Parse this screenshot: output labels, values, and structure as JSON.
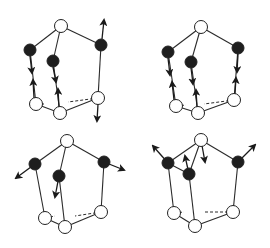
{
  "figure": {
    "colors": {
      "line": "#2a2a2a",
      "black_atom": "#1e1e1e",
      "white_atom": "#ffffff",
      "arrow": "#1a1a1a"
    }
  },
  "panels": [
    {
      "id": "top-left",
      "nodes": [
        {
          "id": "T",
          "x": 61,
          "y": 26,
          "type": "white"
        },
        {
          "id": "L",
          "x": 30,
          "y": 50,
          "type": "black"
        },
        {
          "id": "M",
          "x": 53,
          "y": 61,
          "type": "black"
        },
        {
          "id": "R",
          "x": 101,
          "y": 45,
          "type": "black"
        },
        {
          "id": "BL",
          "x": 36,
          "y": 104,
          "type": "white"
        },
        {
          "id": "BM",
          "x": 60,
          "y": 113,
          "type": "white"
        },
        {
          "id": "BR",
          "x": 98,
          "y": 98,
          "type": "white"
        }
      ],
      "edges": [
        [
          "T",
          "L"
        ],
        [
          "T",
          "M"
        ],
        [
          "T",
          "R"
        ],
        [
          "L",
          "BL"
        ],
        [
          "M",
          "BM"
        ],
        [
          "R",
          "BR"
        ],
        [
          "BL",
          "BM"
        ],
        [
          "BM",
          "BR"
        ]
      ],
      "dashed": [
        [
          "BL",
          46,
          104
        ],
        [
          "BR",
          68,
          102
        ]
      ],
      "arrows": [
        {
          "x1": 30,
          "y1": 56,
          "x2": 32,
          "y2": 73
        },
        {
          "x1": 34,
          "y1": 98,
          "x2": 33,
          "y2": 80
        },
        {
          "x1": 53,
          "y1": 67,
          "x2": 56,
          "y2": 82
        },
        {
          "x1": 59,
          "y1": 107,
          "x2": 58,
          "y2": 89
        },
        {
          "x1": 102,
          "y1": 39,
          "x2": 104,
          "y2": 20
        },
        {
          "x1": 98,
          "y1": 104,
          "x2": 97,
          "y2": 121
        }
      ]
    },
    {
      "id": "top-right",
      "nodes": [
        {
          "id": "T",
          "x": 201,
          "y": 27,
          "type": "white"
        },
        {
          "id": "L",
          "x": 168,
          "y": 52,
          "type": "black"
        },
        {
          "id": "M",
          "x": 191,
          "y": 62,
          "type": "black"
        },
        {
          "id": "R",
          "x": 238,
          "y": 48,
          "type": "black"
        },
        {
          "id": "BL",
          "x": 176,
          "y": 106,
          "type": "white"
        },
        {
          "id": "BM",
          "x": 198,
          "y": 113,
          "type": "white"
        },
        {
          "id": "BR",
          "x": 234,
          "y": 100,
          "type": "white"
        }
      ],
      "edges": [
        [
          "T",
          "L"
        ],
        [
          "T",
          "M"
        ],
        [
          "T",
          "R"
        ],
        [
          "L",
          "BL"
        ],
        [
          "M",
          "BM"
        ],
        [
          "R",
          "BR"
        ],
        [
          "BL",
          "BM"
        ],
        [
          "BM",
          "BR"
        ]
      ],
      "dashed": [
        [
          "BL",
          186,
          105
        ],
        [
          "BR",
          204,
          104
        ]
      ],
      "arrows": [
        {
          "x1": 168,
          "y1": 58,
          "x2": 170,
          "y2": 75
        },
        {
          "x1": 174,
          "y1": 100,
          "x2": 172,
          "y2": 82
        },
        {
          "x1": 191,
          "y1": 68,
          "x2": 193,
          "y2": 84
        },
        {
          "x1": 197,
          "y1": 107,
          "x2": 196,
          "y2": 90
        },
        {
          "x1": 238,
          "y1": 54,
          "x2": 237,
          "y2": 72
        },
        {
          "x1": 235,
          "y1": 94,
          "x2": 236,
          "y2": 78
        }
      ]
    },
    {
      "id": "bottom-left",
      "nodes": [
        {
          "id": "T",
          "x": 67,
          "y": 141,
          "type": "white"
        },
        {
          "id": "L",
          "x": 35,
          "y": 164,
          "type": "black"
        },
        {
          "id": "M",
          "x": 59,
          "y": 176,
          "type": "black"
        },
        {
          "id": "R",
          "x": 104,
          "y": 162,
          "type": "black"
        },
        {
          "id": "BL",
          "x": 45,
          "y": 218,
          "type": "white"
        },
        {
          "id": "BM",
          "x": 65,
          "y": 227,
          "type": "white"
        },
        {
          "id": "BR",
          "x": 101,
          "y": 212,
          "type": "white"
        }
      ],
      "edges": [
        [
          "T",
          "L"
        ],
        [
          "T",
          "M"
        ],
        [
          "T",
          "R"
        ],
        [
          "L",
          "BL"
        ],
        [
          "M",
          "BM"
        ],
        [
          "R",
          "BR"
        ],
        [
          "BL",
          "BM"
        ],
        [
          "BM",
          "BR"
        ]
      ],
      "dashed": [
        [
          "BL",
          55,
          216
        ],
        [
          "BR",
          75,
          216
        ]
      ],
      "arrows": [
        {
          "x1": 35,
          "y1": 164,
          "x2": 16,
          "y2": 178
        },
        {
          "x1": 59,
          "y1": 176,
          "x2": 55,
          "y2": 197
        },
        {
          "x1": 104,
          "y1": 162,
          "x2": 124,
          "y2": 170
        }
      ]
    },
    {
      "id": "bottom-right",
      "nodes": [
        {
          "id": "T",
          "x": 201,
          "y": 140,
          "type": "white"
        },
        {
          "id": "L",
          "x": 168,
          "y": 163,
          "type": "black"
        },
        {
          "id": "M",
          "x": 189,
          "y": 174,
          "type": "black"
        },
        {
          "id": "R",
          "x": 238,
          "y": 162,
          "type": "black"
        },
        {
          "id": "BL",
          "x": 174,
          "y": 213,
          "type": "white"
        },
        {
          "id": "BM",
          "x": 195,
          "y": 226,
          "type": "white"
        },
        {
          "id": "BR",
          "x": 233,
          "y": 212,
          "type": "white"
        }
      ],
      "edges": [
        [
          "T",
          "L"
        ],
        [
          "T",
          "M"
        ],
        [
          "T",
          "R"
        ],
        [
          "L",
          "BL"
        ],
        [
          "M",
          "BM"
        ],
        [
          "R",
          "BR"
        ],
        [
          "BL",
          "BM"
        ],
        [
          "BM",
          "BR"
        ],
        [
          "L",
          "M"
        ]
      ],
      "dashed": [
        [
          "BL",
          184,
          212
        ],
        [
          "BR",
          204,
          212
        ]
      ],
      "arrows": [
        {
          "x1": 168,
          "y1": 163,
          "x2": 153,
          "y2": 146
        },
        {
          "x1": 189,
          "y1": 174,
          "x2": 185,
          "y2": 156
        },
        {
          "x1": 201,
          "y1": 140,
          "x2": 205,
          "y2": 162
        },
        {
          "x1": 238,
          "y1": 162,
          "x2": 255,
          "y2": 145
        }
      ]
    }
  ]
}
